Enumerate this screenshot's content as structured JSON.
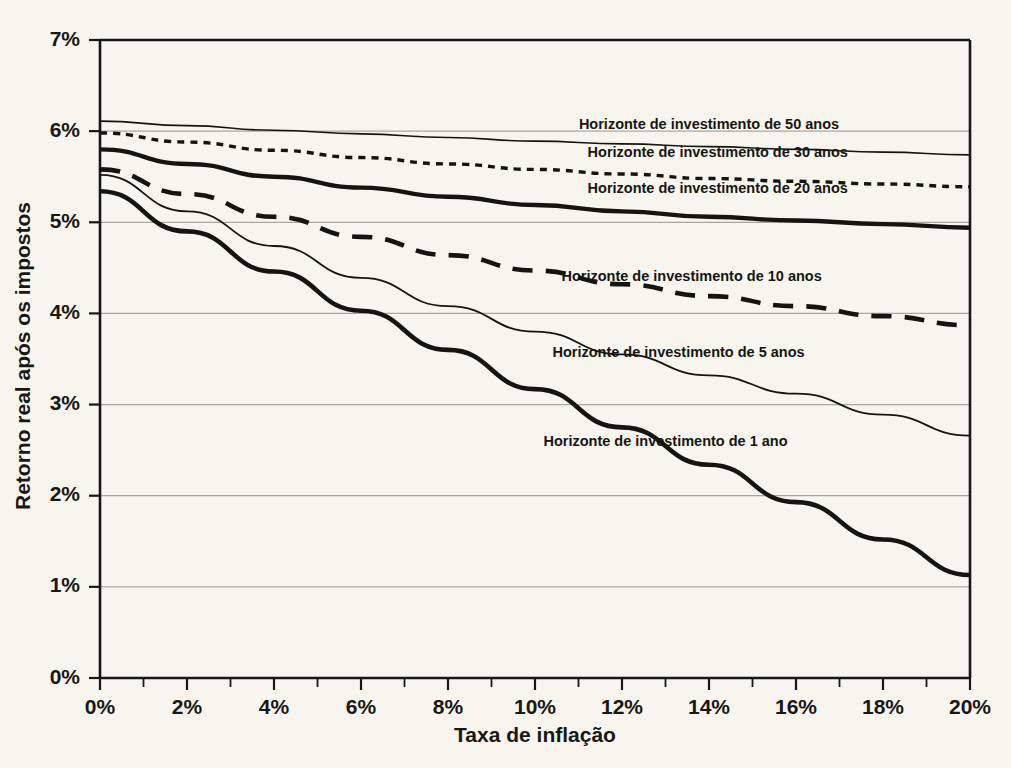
{
  "chart_data": {
    "type": "line",
    "title": "",
    "xlabel": "Taxa de inflação",
    "ylabel": "Retorno real após os impostos",
    "xlim": [
      0,
      20
    ],
    "ylim": [
      0,
      7
    ],
    "xticks": [
      "0%",
      "2%",
      "4%",
      "6%",
      "8%",
      "10%",
      "12%",
      "14%",
      "16%",
      "18%",
      "20%"
    ],
    "xtick_values": [
      0,
      2,
      4,
      6,
      8,
      10,
      12,
      14,
      16,
      18,
      20
    ],
    "yticks": [
      "0%",
      "1%",
      "2%",
      "3%",
      "4%",
      "5%",
      "6%",
      "7%"
    ],
    "ytick_values": [
      0,
      1,
      2,
      3,
      4,
      5,
      6,
      7
    ],
    "grid": "horizontal",
    "legend_position": "inline-right",
    "x": [
      0,
      2,
      4,
      6,
      8,
      10,
      12,
      14,
      16,
      18,
      20
    ],
    "series": [
      {
        "name": "Horizonte de investimento de 50 anos",
        "label": "Horizonte de investimento de 50 anos",
        "style": "solid-thin",
        "stroke_width": 1.6,
        "dash": "none",
        "color": "#15150f",
        "values": [
          6.11,
          6.06,
          6.01,
          5.97,
          5.93,
          5.89,
          5.86,
          5.83,
          5.8,
          5.77,
          5.74
        ],
        "label_x": 14.0,
        "label_y": 6.02
      },
      {
        "name": "Horizonte de investimento de 30 anos",
        "label": "Horizonte de investimento de 30 anos",
        "style": "dotted",
        "stroke_width": 3.4,
        "dash": "7,6",
        "color": "#15150f",
        "values": [
          5.98,
          5.88,
          5.79,
          5.71,
          5.64,
          5.58,
          5.53,
          5.48,
          5.45,
          5.42,
          5.39
        ],
        "label_x": 14.2,
        "label_y": 5.72
      },
      {
        "name": "Horizonte de investimento de 20 anos",
        "label": "Horizonte de investimento de 20 anos",
        "style": "solid-thick",
        "stroke_width": 4.4,
        "dash": "none",
        "color": "#15150f",
        "values": [
          5.8,
          5.64,
          5.5,
          5.38,
          5.28,
          5.19,
          5.12,
          5.06,
          5.02,
          4.98,
          4.94
        ],
        "label_x": 14.2,
        "label_y": 5.32
      },
      {
        "name": "Horizonte de investimento de 10 anos",
        "label": "Horizonte de investimento de 10 anos",
        "style": "dashed",
        "stroke_width": 4.6,
        "dash": "20,13",
        "color": "#15150f",
        "values": [
          5.58,
          5.31,
          5.06,
          4.84,
          4.64,
          4.47,
          4.32,
          4.19,
          4.08,
          3.97,
          3.87
        ],
        "label_x": 13.6,
        "label_y": 4.36
      },
      {
        "name": "Horizonte de investimento de 5 anos",
        "label": "Horizonte de investimento de 5 anos",
        "style": "solid-thin",
        "stroke_width": 1.8,
        "dash": "none",
        "color": "#15150f",
        "values": [
          5.52,
          5.12,
          4.74,
          4.39,
          4.08,
          3.8,
          3.55,
          3.32,
          3.12,
          2.89,
          2.66
        ],
        "label_x": 13.3,
        "label_y": 3.52
      },
      {
        "name": "Horizonte de investimento de 1 ano",
        "label": "Horizonte de investimento de 1 ano",
        "style": "solid-thick",
        "stroke_width": 4.6,
        "dash": "none",
        "color": "#15150f",
        "values": [
          5.34,
          4.9,
          4.46,
          4.03,
          3.6,
          3.17,
          2.75,
          2.34,
          1.93,
          1.52,
          1.13
        ],
        "label_x": 13.0,
        "label_y": 2.54
      }
    ]
  },
  "axes": {
    "x_axis_title": "Taxa de inflação",
    "y_axis_title": "Retorno real após os impostos"
  },
  "colors": {
    "background": "#f7f5ee",
    "line": "#15150f",
    "grid": "#a9a89f",
    "axis": "#171714",
    "text": "#171714"
  }
}
